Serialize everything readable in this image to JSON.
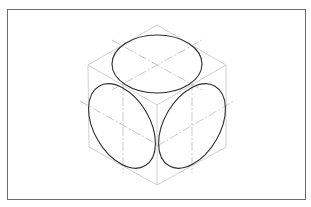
{
  "diagram": {
    "title": "",
    "colors": {
      "frame": "#6b6b6b",
      "cube_edges": "#c4c4c4",
      "center_lines": "#bdbdbd",
      "ellipses": "#2e2e2e",
      "background": "#ffffff"
    },
    "cube": {
      "top": [
        157,
        25
      ],
      "upper_left": [
        88,
        65
      ],
      "upper_right": [
        226,
        65
      ],
      "front": [
        157,
        105
      ],
      "lower_left": [
        89,
        147
      ],
      "lower_right": [
        226,
        147
      ],
      "bottom": [
        157,
        185
      ]
    },
    "ellipses": [
      {
        "face": "top",
        "cx": 157,
        "cy": 64,
        "rx": 45,
        "ry": 29,
        "rotate": 0
      },
      {
        "face": "left",
        "cx": 122,
        "cy": 126,
        "rx": 46,
        "ry": 29,
        "rotate": 60
      },
      {
        "face": "right",
        "cx": 192,
        "cy": 126,
        "rx": 46,
        "ry": 29,
        "rotate": -60
      }
    ]
  }
}
